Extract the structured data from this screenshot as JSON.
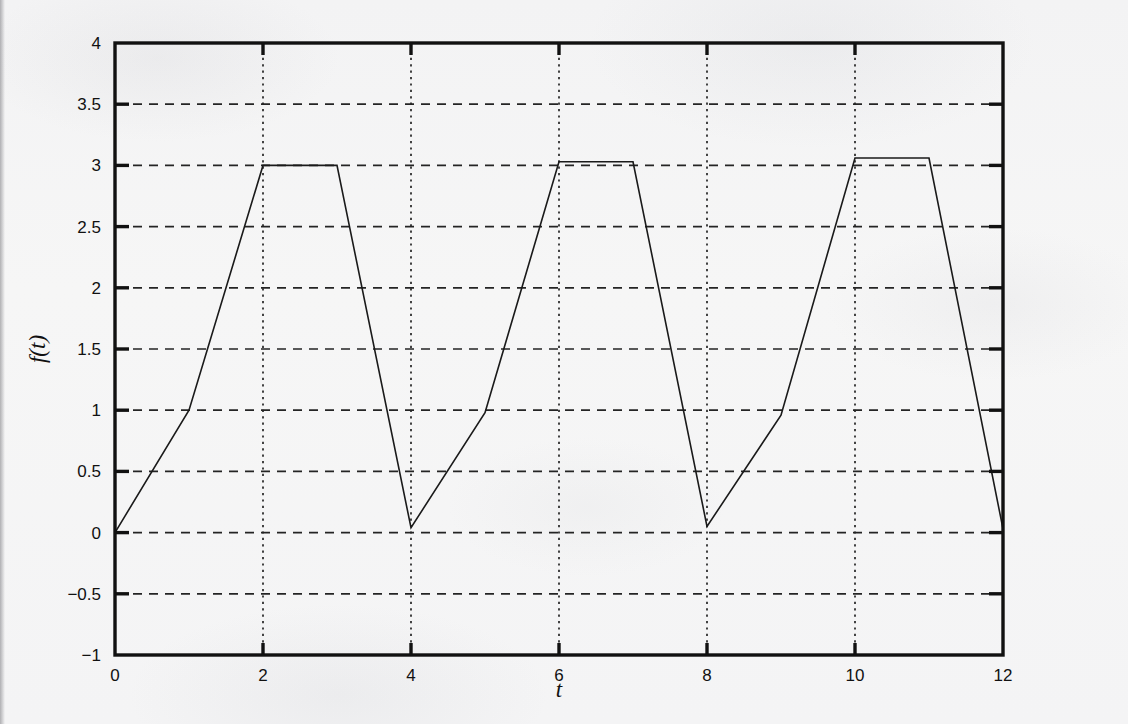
{
  "chart_data": {
    "type": "line",
    "title": "",
    "subtitle": "",
    "xlabel": "t",
    "ylabel": "f(t)",
    "xlim": [
      0,
      12
    ],
    "ylim": [
      -1,
      4
    ],
    "xticks": [
      0,
      2,
      4,
      6,
      8,
      10,
      12
    ],
    "xtick_labels": [
      "0",
      "2",
      "4",
      "6",
      "8",
      "10",
      "12"
    ],
    "yticks": [
      -1,
      -0.5,
      0,
      0.5,
      1,
      1.5,
      2,
      2.5,
      3,
      3.5,
      4
    ],
    "ytick_labels": [
      "−1",
      "−0.5",
      "0",
      "0.5",
      "1",
      "1.5",
      "2",
      "2.5",
      "3",
      "3.5",
      "4"
    ],
    "grid": true,
    "grid_x_style": "dotted",
    "grid_y_style": "dashed",
    "legend": "none",
    "line_color": "#1a1a1a",
    "line_width": 1.6,
    "series": [
      {
        "name": "f(t)",
        "x": [
          0,
          1,
          2,
          3,
          4,
          5,
          6,
          7,
          8,
          9,
          10,
          11,
          12
        ],
        "y": [
          0,
          1,
          3,
          3,
          0.04,
          0.98,
          3.03,
          3.03,
          0.05,
          0.96,
          3.06,
          3.06,
          0.03
        ]
      }
    ]
  },
  "axes": {
    "frame_color": "#111111",
    "frame_width": 3,
    "tick_color": "#111111",
    "grid_color": "#222222",
    "background": "#f5f5f5"
  },
  "icons": {
    "chart_icon": "line-chart-icon"
  }
}
